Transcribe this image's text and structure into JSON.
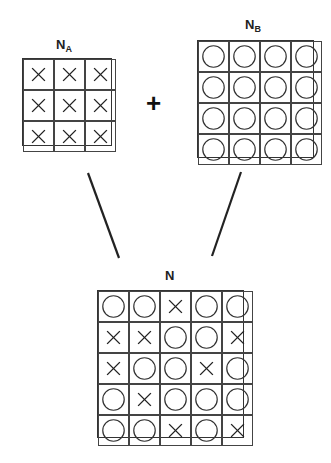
{
  "labels": {
    "na_main": "N",
    "na_sub": "A",
    "nb_main": "N",
    "nb_sub": "B",
    "n_main": "N",
    "plus": "+"
  },
  "grids": {
    "NA": [
      [
        "X",
        "X",
        "X"
      ],
      [
        "X",
        "X",
        "X"
      ],
      [
        "X",
        "X",
        "X"
      ]
    ],
    "NB": [
      [
        "O",
        "O",
        "O",
        "O"
      ],
      [
        "O",
        "O",
        "O",
        "O"
      ],
      [
        "O",
        "O",
        "O",
        "O"
      ],
      [
        "O",
        "O",
        "O",
        "O"
      ]
    ],
    "N": [
      [
        "O",
        "O",
        "X",
        "O",
        "O"
      ],
      [
        "X",
        "X",
        "O",
        "O",
        "X"
      ],
      [
        "X",
        "O",
        "O",
        "X",
        "O"
      ],
      [
        "O",
        "X",
        "O",
        "O",
        "O"
      ],
      [
        "O",
        "O",
        "X",
        "O",
        "X"
      ]
    ]
  },
  "colors": {
    "stroke": "#333333"
  }
}
